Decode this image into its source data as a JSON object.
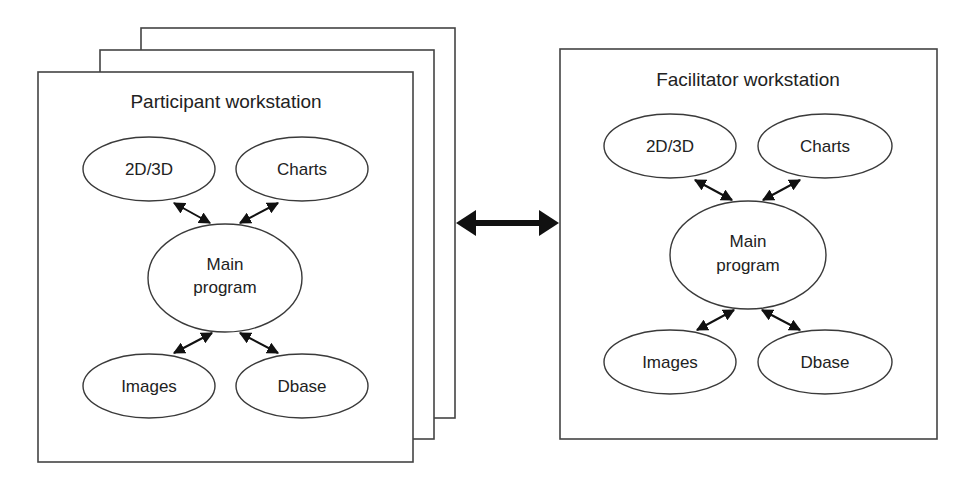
{
  "diagram": {
    "participant": {
      "title": "Participant workstation",
      "stack_count": 3,
      "nodes": {
        "n2d3d": "2D/3D",
        "charts": "Charts",
        "main_line1": "Main",
        "main_line2": "program",
        "images": "Images",
        "dbase": "Dbase"
      }
    },
    "facilitator": {
      "title": "Facilitator workstation",
      "nodes": {
        "n2d3d": "2D/3D",
        "charts": "Charts",
        "main_line1": "Main",
        "main_line2": "program",
        "images": "Images",
        "dbase": "Dbase"
      }
    },
    "link": {
      "type": "bidirectional",
      "from": "Participant workstation",
      "to": "Facilitator workstation"
    },
    "edges": [
      {
        "from": "2D/3D",
        "to": "Main program",
        "type": "bidirectional"
      },
      {
        "from": "Charts",
        "to": "Main program",
        "type": "bidirectional"
      },
      {
        "from": "Images",
        "to": "Main program",
        "type": "bidirectional"
      },
      {
        "from": "Dbase",
        "to": "Main program",
        "type": "bidirectional"
      }
    ],
    "colors": {
      "stroke": "#3a3a3a",
      "arrow": "#111111",
      "background": "#ffffff",
      "text": "#222222"
    }
  }
}
